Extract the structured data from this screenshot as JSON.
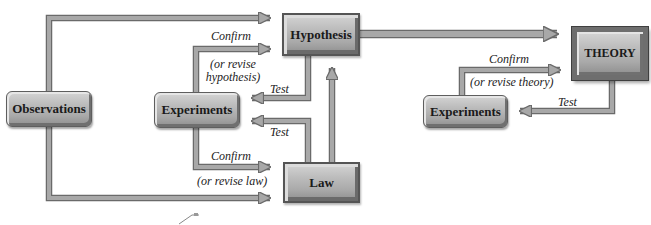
{
  "diagram": {
    "colors": {
      "arrow_fill": "#a8a8a8",
      "arrow_outline": "#6a6a6a",
      "box_fill_light": "#d4d4d4",
      "box_fill_dark": "#8e8e8e",
      "text": "#1a1a1a"
    },
    "nodes": {
      "observations": "Observations",
      "hypothesis": "Hypothesis",
      "experiments_left": "Experiments",
      "law": "Law",
      "theory": "THEORY",
      "experiments_right": "Experiments"
    },
    "labels": {
      "confirm_hypothesis": "Confirm",
      "revise_hypothesis_line1": "(or revise",
      "revise_hypothesis_line2": "hypothesis)",
      "test_hypothesis": "Test",
      "test_law": "Test",
      "confirm_law": "Confirm",
      "revise_law": "(or revise law)",
      "confirm_theory": "Confirm",
      "revise_theory": "(or revise theory)",
      "test_theory": "Test"
    },
    "edges": [
      {
        "from": "Observations",
        "to": "Hypothesis"
      },
      {
        "from": "Observations",
        "to": "Law"
      },
      {
        "from": "Experiments",
        "to": "Hypothesis",
        "label": "Confirm (or revise hypothesis)"
      },
      {
        "from": "Hypothesis",
        "to": "Experiments",
        "label": "Test"
      },
      {
        "from": "Law",
        "to": "Experiments",
        "label": "Test"
      },
      {
        "from": "Experiments",
        "to": "Law",
        "label": "Confirm (or revise law)"
      },
      {
        "from": "Law",
        "to": "Hypothesis"
      },
      {
        "from": "Hypothesis",
        "to": "THEORY"
      },
      {
        "from": "Experiments",
        "to": "THEORY",
        "label": "Confirm (or revise theory)"
      },
      {
        "from": "THEORY",
        "to": "Experiments",
        "label": "Test"
      }
    ]
  }
}
